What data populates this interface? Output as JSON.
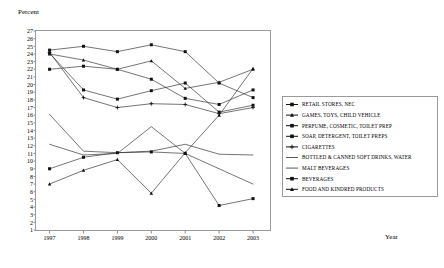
{
  "chart_data": {
    "type": "line",
    "title": "",
    "xlabel": "Year",
    "ylabel": "Percent",
    "x": [
      1997,
      1998,
      1999,
      2000,
      2001,
      2002,
      2003
    ],
    "categories": [
      "1997",
      "1998",
      "1999",
      "2000",
      "2001",
      "2002",
      "2003"
    ],
    "xlim": [
      1996.6,
      2003.5
    ],
    "ylim": [
      1,
      27
    ],
    "yticks": [
      1,
      2,
      3,
      4,
      5,
      6,
      7,
      8,
      9,
      10,
      11,
      12,
      13,
      14,
      15,
      16,
      17,
      18,
      19,
      20,
      21,
      22,
      23,
      24,
      25,
      26,
      27
    ],
    "grid": false,
    "legend_position": "right",
    "series": [
      {
        "name": "RETAIL STORES, NEC",
        "marker": "square",
        "values": [
          24.5,
          25.0,
          24.3,
          25.2,
          24.3,
          20.2,
          18.3
        ]
      },
      {
        "name": "GAMES, TOYS, CHILD VEHICLE",
        "marker": "triangle",
        "values": [
          24.0,
          23.2,
          22.0,
          23.1,
          19.5,
          20.3,
          22.0
        ]
      },
      {
        "name": "PERFUME, COSMETIC, TOILET PREP",
        "marker": "square",
        "values": [
          22.0,
          22.4,
          22.0,
          20.7,
          18.2,
          17.4,
          19.3
        ]
      },
      {
        "name": "SOAP, DETERGENT, TOILET PREPS",
        "marker": "square",
        "values": [
          24.1,
          19.3,
          18.1,
          19.2,
          20.2,
          16.4,
          17.3
        ]
      },
      {
        "name": "CIGARETTES",
        "marker": "plus",
        "values": [
          24.2,
          18.3,
          17.0,
          17.5,
          17.4,
          16.2,
          17.0
        ]
      },
      {
        "name": "BOTTLED & CANNED SOFT DRINKS, WATER",
        "marker": "none",
        "values": [
          16.1,
          11.3,
          11.1,
          11.3,
          12.2,
          10.9,
          10.8
        ]
      },
      {
        "name": "MALT BEVERAGES",
        "marker": "none",
        "values": [
          12.2,
          10.8,
          11.0,
          14.5,
          11.0,
          9.0,
          7.0
        ]
      },
      {
        "name": "BEVERAGES",
        "marker": "square",
        "values": [
          9.0,
          10.5,
          11.1,
          11.2,
          11.0,
          4.2,
          5.1
        ]
      },
      {
        "name": "FOOD AND KINDRED PRODUCTS",
        "marker": "triangle",
        "values": [
          7.0,
          8.8,
          10.2,
          5.8,
          11.1,
          16.0,
          22.1
        ]
      }
    ]
  }
}
